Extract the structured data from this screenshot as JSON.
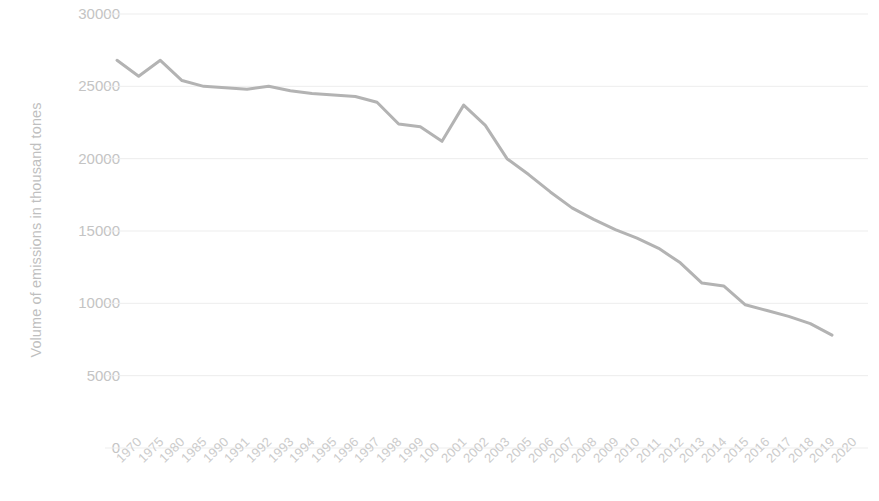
{
  "chart_data": {
    "type": "line",
    "title": "",
    "xlabel": "",
    "ylabel": "Volume of emissions in thousand tones",
    "ylim": [
      0,
      30000
    ],
    "ytick_labels": [
      "0",
      "5000",
      "10000",
      "15000",
      "20000",
      "25000",
      "30000"
    ],
    "ytick_values": [
      0,
      5000,
      10000,
      15000,
      20000,
      25000,
      30000
    ],
    "grid": true,
    "legend": "none",
    "line_color": "#b3b3b3",
    "line_width": 3,
    "categories": [
      "1970",
      "1975",
      "1980",
      "1985",
      "1990",
      "1991",
      "1992",
      "1993",
      "1994",
      "1995",
      "1996",
      "1997",
      "1998",
      "1999",
      "100",
      "2001",
      "2002",
      "2003",
      "2005",
      "2006",
      "2007",
      "2008",
      "2009",
      "2010",
      "2011",
      "2012",
      "2013",
      "2014",
      "2015",
      "2016",
      "2017",
      "2018",
      "2019",
      "2020"
    ],
    "values": [
      26800,
      25700,
      26800,
      25400,
      25000,
      24900,
      24800,
      25000,
      24700,
      24500,
      24400,
      24300,
      23900,
      22400,
      22200,
      21200,
      23700,
      22300,
      20000,
      18900,
      17700,
      16600,
      15800,
      15100,
      14500,
      13800,
      12800,
      11400,
      11200,
      9900,
      9500,
      9100,
      8600,
      7800
    ],
    "series": [
      {
        "name": "Volume of emissions",
        "color": "#b3b3b3",
        "values": [
          26800,
          25700,
          26800,
          25400,
          25000,
          24900,
          24800,
          25000,
          24700,
          24500,
          24400,
          24300,
          23900,
          22400,
          22200,
          21200,
          23700,
          22300,
          20000,
          18900,
          17700,
          16600,
          15800,
          15100,
          14500,
          13800,
          12800,
          11400,
          11200,
          9900,
          9500,
          9100,
          8600,
          7800
        ]
      }
    ]
  },
  "axis": {
    "y_title": "Volume of emissions in thousand tones"
  },
  "colors": {
    "line": "#b3b3b3",
    "grid": "#ededed",
    "tick_text": "#c4c4c4"
  }
}
